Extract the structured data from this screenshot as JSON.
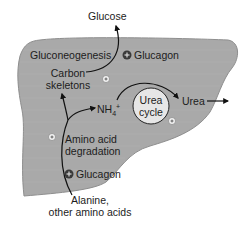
{
  "diagram": {
    "organ": "liver",
    "colors": {
      "liver_fill": "#a9a9a9",
      "liver_stroke": "#8e8e8e",
      "arrow": "#111111",
      "glucagon_badge": "#3a3a3a",
      "small_badge": "#f4f4f4"
    },
    "labels": {
      "glucose": "Glucose",
      "gluconeogenesis": "Gluconeogenesis",
      "glucagon_top": "Glucagon",
      "carbon_line1": "Carbon",
      "carbon_line2": "skeletons",
      "nh4": "NH",
      "nh4_sub": "4",
      "nh4_sup": "+",
      "urea_cycle_line1": "Urea",
      "urea_cycle_line2": "cycle",
      "urea": "Urea",
      "amino_line1": "Amino acid",
      "amino_line2": "degradation",
      "glucagon_bottom": "Glucagon",
      "alanine_line1": "Alanine,",
      "alanine_line2": "other amino acids"
    },
    "badges": {
      "glucagon_sign": "+",
      "stimulate_sign": "+"
    }
  }
}
